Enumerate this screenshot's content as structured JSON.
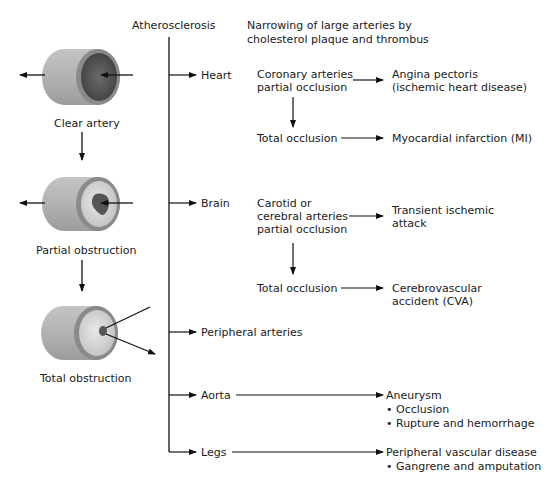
{
  "diagram": {
    "root": "Atherosclerosis",
    "root_description": [
      "Narrowing of large arteries by",
      "cholesterol plaque and thrombus"
    ],
    "artery_stages": [
      {
        "label": "Clear artery"
      },
      {
        "label": "Partial obstruction"
      },
      {
        "label": "Total obstruction"
      }
    ],
    "branches": {
      "heart": {
        "label": "Heart",
        "partial": [
          "Coronary arteries",
          "partial occlusion"
        ],
        "partial_outcome": [
          "Angina pectoris",
          "(ischemic heart disease)"
        ],
        "total": "Total occlusion",
        "total_outcome": "Myocardial infarction (MI)"
      },
      "brain": {
        "label": "Brain",
        "partial": [
          "Carotid or",
          "cerebral arteries",
          "partial occlusion"
        ],
        "partial_outcome": [
          "Transient ischemic",
          "attack"
        ],
        "total": "Total occlusion",
        "total_outcome": [
          "Cerebrovascular",
          "accident (CVA)"
        ]
      },
      "peripheral": {
        "label": "Peripheral arteries"
      },
      "aorta": {
        "label": "Aorta",
        "outcome": "Aneurysm",
        "bullets": [
          "• Occlusion",
          "• Rupture and hemorrhage"
        ]
      },
      "legs": {
        "label": "Legs",
        "outcome": "Peripheral vascular disease",
        "bullets": [
          "• Gangrene and amputation"
        ]
      }
    },
    "colors": {
      "outer_wall": "#b4b4b4",
      "wall_ring": "#8a8a8a",
      "lumen_clear": "#5a5a5a",
      "intima": "#d6d6d6",
      "plaque": "#555555",
      "line": "#111111"
    }
  }
}
